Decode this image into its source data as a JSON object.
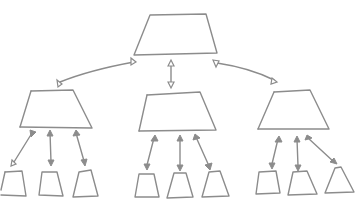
{
  "diagram": {
    "type": "hierarchy-sketch",
    "style": "hand-drawn",
    "stroke_color": "#8c8c8c",
    "background": "#ffffff",
    "levels": 3,
    "root": {
      "shape": "trapezoid",
      "children": 3
    },
    "middle_nodes": [
      {
        "id": "left",
        "shape": "trapezoid",
        "children": 3
      },
      {
        "id": "center",
        "shape": "trapezoid",
        "children": 3
      },
      {
        "id": "right",
        "shape": "trapezoid",
        "children": 3
      }
    ],
    "leaf_count": 9,
    "connectors": "double-headed arrows",
    "text_labels": []
  }
}
